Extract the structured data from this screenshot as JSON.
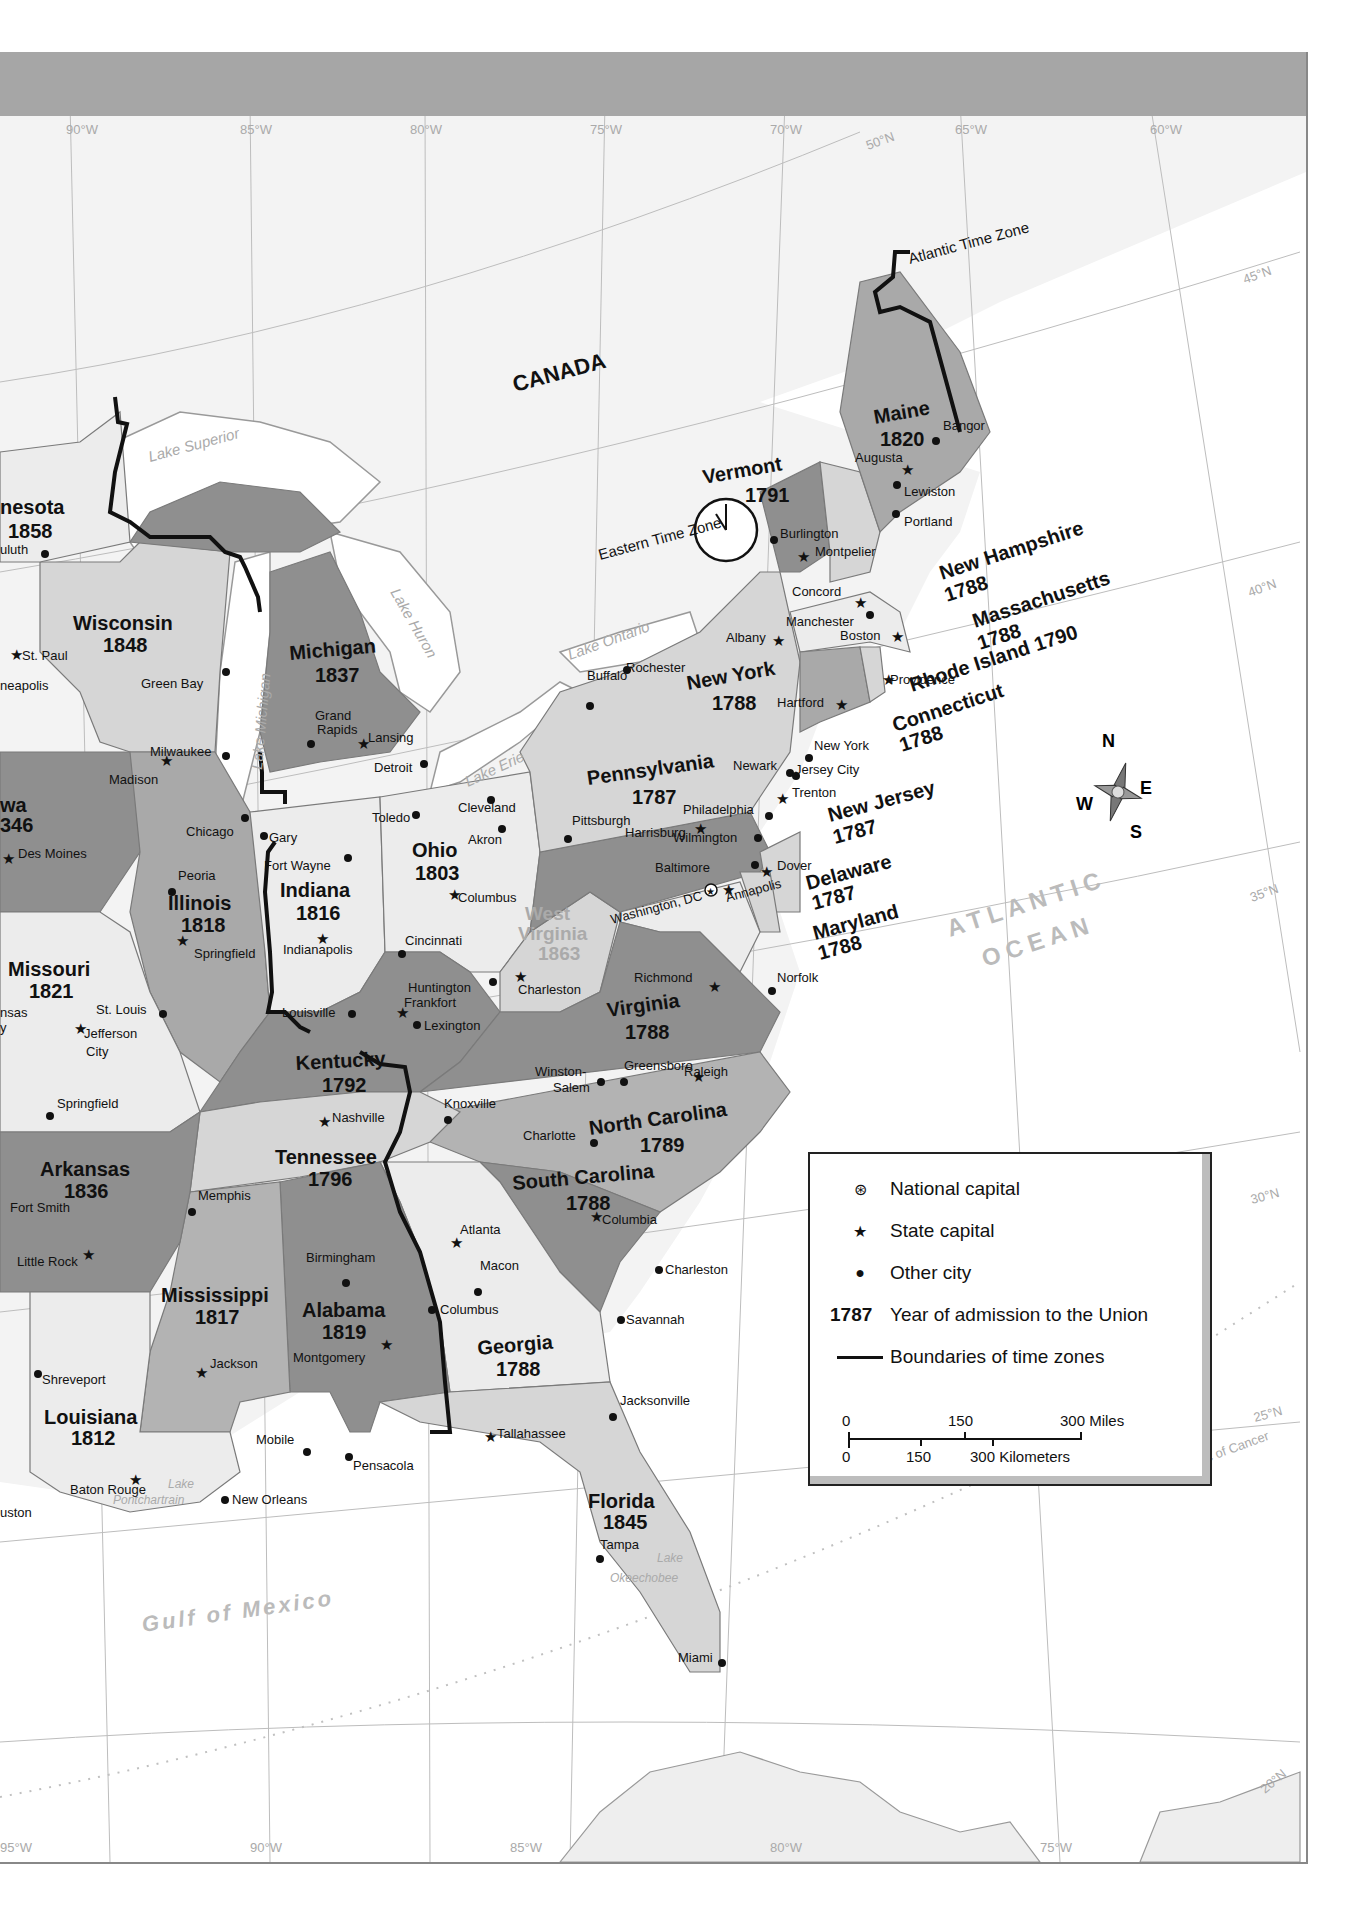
{
  "map": {
    "country_label": "CANADA",
    "ocean_label_1": "ATLANTIC",
    "ocean_label_2": "OCEAN",
    "gulf_label": "Gulf of Mexico",
    "time_zones": {
      "eastern": "Eastern Time Zone",
      "atlantic": "Atlantic Time Zone"
    },
    "longitudes_top": [
      "90°W",
      "85°W",
      "80°W",
      "75°W",
      "70°W",
      "65°W",
      "60°W"
    ],
    "longitudes_bottom": [
      "95°W",
      "90°W",
      "85°W",
      "80°W",
      "75°W"
    ],
    "latitudes": [
      "50°N",
      "45°N",
      "40°N",
      "35°N",
      "30°N",
      "25°N",
      "20°N"
    ],
    "tropic": "Tropic of Cancer",
    "lakes": {
      "superior": "Lake Superior",
      "michigan": "Lake Michigan",
      "huron": "Lake Huron",
      "erie": "Lake Erie",
      "ontario": "Lake Ontario",
      "pontchartrain_1": "Lake",
      "pontchartrain_2": "Pontchartrain",
      "okeechobee_1": "Lake",
      "okeechobee_2": "Okeechobee"
    },
    "compass": {
      "n": "N",
      "s": "S",
      "e": "E",
      "w": "W"
    },
    "states": [
      {
        "name": "Minnesota",
        "label": "nesota",
        "year": "1858"
      },
      {
        "name": "Wisconsin",
        "label": "Wisconsin",
        "year": "1848"
      },
      {
        "name": "Michigan",
        "label": "Michigan",
        "year": "1837"
      },
      {
        "name": "Iowa",
        "label": "wa",
        "year": "346"
      },
      {
        "name": "Illinois",
        "label": "Illinois",
        "year": "1818"
      },
      {
        "name": "Indiana",
        "label": "Indiana",
        "year": "1816"
      },
      {
        "name": "Ohio",
        "label": "Ohio",
        "year": "1803"
      },
      {
        "name": "Missouri",
        "label": "Missouri",
        "year": "1821"
      },
      {
        "name": "Kentucky",
        "label": "Kentucky",
        "year": "1792"
      },
      {
        "name": "West Virginia",
        "label_1": "West",
        "label_2": "Virginia",
        "year": "1863"
      },
      {
        "name": "Tennessee",
        "label": "Tennessee",
        "year": "1796"
      },
      {
        "name": "Arkansas",
        "label": "Arkansas",
        "year": "1836"
      },
      {
        "name": "Mississippi",
        "label": "Mississippi",
        "year": "1817"
      },
      {
        "name": "Alabama",
        "label": "Alabama",
        "year": "1819"
      },
      {
        "name": "Louisiana",
        "label": "Louisiana",
        "year": "1812"
      },
      {
        "name": "Georgia",
        "label": "Georgia",
        "year": "1788"
      },
      {
        "name": "South Carolina",
        "label": "South Carolina",
        "year": "1788"
      },
      {
        "name": "North Carolina",
        "label": "North Carolina",
        "year": "1789"
      },
      {
        "name": "Virginia",
        "label": "Virginia",
        "year": "1788"
      },
      {
        "name": "Florida",
        "label": "Florida",
        "year": "1845"
      },
      {
        "name": "Pennsylvania",
        "label": "Pennsylvania",
        "year": "1787"
      },
      {
        "name": "New York",
        "label": "New York",
        "year": "1788"
      },
      {
        "name": "Vermont",
        "label": "Vermont",
        "year": "1791"
      },
      {
        "name": "Maine",
        "label": "Maine",
        "year": "1820"
      },
      {
        "name": "New Hampshire",
        "label": "New Hampshire",
        "year": "1788"
      },
      {
        "name": "Massachusetts",
        "label": "Massachusetts",
        "year": "1788"
      },
      {
        "name": "Rhode Island",
        "label": "Rhode Island 1790",
        "year": "1790"
      },
      {
        "name": "Connecticut",
        "label": "Connecticut",
        "year": "1788"
      },
      {
        "name": "New Jersey",
        "label": "New Jersey",
        "year": "1787"
      },
      {
        "name": "Delaware",
        "label": "Delaware",
        "year": "1787"
      },
      {
        "name": "Maryland",
        "label": "Maryland",
        "year": "1788"
      }
    ],
    "cities": {
      "duluth": "uluth",
      "st_paul": "St. Paul",
      "minneapolis": "neapolis",
      "green_bay": "Green Bay",
      "milwaukee": "Milwaukee",
      "madison": "Madison",
      "grand_rapids_1": "Grand",
      "grand_rapids_2": "Rapids",
      "lansing": "Lansing",
      "detroit": "Detroit",
      "chicago": "Chicago",
      "gary": "Gary",
      "fort_wayne": "Fort Wayne",
      "des_moines": "Des Moines",
      "peoria": "Peoria",
      "springfield_il": "Springfield",
      "indianapolis": "Indianapolis",
      "toledo": "Toledo",
      "cleveland": "Cleveland",
      "akron": "Akron",
      "columbus_oh": "Columbus",
      "cincinnati": "Cincinnati",
      "st_louis": "St. Louis",
      "jefferson_city_1": "Jefferson",
      "jefferson_city_2": "City",
      "kansas_city_1": "nsas",
      "kansas_city_2": "y",
      "springfield_mo": "Springfield",
      "louisville": "Louisville",
      "frankfort": "Frankfort",
      "lexington": "Lexington",
      "huntington": "Huntington",
      "charleston_wv": "Charleston",
      "nashville": "Nashville",
      "knoxville": "Knoxville",
      "memphis": "Memphis",
      "fort_smith": "Fort Smith",
      "little_rock": "Little Rock",
      "birmingham": "Birmingham",
      "montgomery": "Montgomery",
      "jackson": "Jackson",
      "shreveport": "Shreveport",
      "baton_rouge": "Baton Rouge",
      "new_orleans": "New Orleans",
      "mobile": "Mobile",
      "pensacola": "Pensacola",
      "tallahassee": "Tallahassee",
      "jacksonville": "Jacksonville",
      "tampa": "Tampa",
      "miami": "Miami",
      "atlanta": "Atlanta",
      "macon": "Macon",
      "columbus_ga": "Columbus",
      "savannah": "Savannah",
      "charleston_sc": "Charleston",
      "columbia": "Columbia",
      "charlotte": "Charlotte",
      "winston_salem_1": "Winston-",
      "winston_salem_2": "Salem",
      "greensboro": "Greensboro",
      "raleigh": "Raleigh",
      "richmond": "Richmond",
      "norfolk": "Norfolk",
      "washington_dc": "Washington, DC",
      "annapolis": "Annapolis",
      "baltimore": "Baltimore",
      "dover": "Dover",
      "wilmington": "Wilmington",
      "philadelphia": "Philadelphia",
      "harrisburg": "Harrisburg",
      "pittsburgh": "Pittsburgh",
      "trenton": "Trenton",
      "newark": "Newark",
      "jersey_city": "Jersey City",
      "new_york_city": "New York",
      "hartford": "Hartford",
      "providence": "Providence",
      "boston": "Boston",
      "albany": "Albany",
      "buffalo": "Buffalo",
      "rochester": "Rochester",
      "manchester": "Manchester",
      "concord": "Concord",
      "montpelier": "Montpelier",
      "burlington": "Burlington",
      "portland": "Portland",
      "lewiston": "Lewiston",
      "augusta": "Augusta",
      "bangor": "Bangor",
      "houston": "uston"
    }
  },
  "legend": {
    "items": [
      {
        "symbol": "national-capital",
        "label": "National capital"
      },
      {
        "symbol": "state-capital",
        "label": "State capital"
      },
      {
        "symbol": "other-city",
        "label": "Other city"
      },
      {
        "symbol": "year",
        "year_sample": "1787",
        "label": "Year of admission to the Union"
      },
      {
        "symbol": "time-zone-line",
        "label": "Boundaries of time zones"
      }
    ],
    "scale": {
      "miles": [
        "0",
        "150",
        "300 Miles"
      ],
      "kilometers": [
        "0",
        "150",
        "300 Kilometers"
      ]
    }
  },
  "colors": {
    "dark_state": "#8f8f8f",
    "mid_state": "#b3b3b3",
    "light_state": "#d6d6d6",
    "pale_state": "#ececec",
    "water": "#ffffff",
    "foreign_land": "#f2f2f2",
    "title_band": "#a6a6a6"
  }
}
